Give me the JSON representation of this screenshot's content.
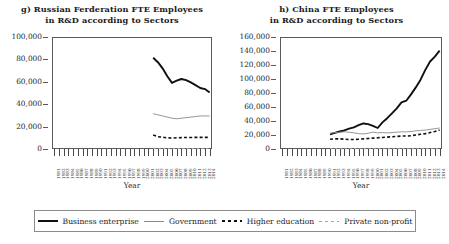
{
  "legend": {
    "items": [
      {
        "key": "business",
        "label": "Business enterprise",
        "color": "#101010",
        "style": "solid-thick"
      },
      {
        "key": "government",
        "label": "Government",
        "color": "#8a8a8a",
        "style": "solid-thin"
      },
      {
        "key": "higher",
        "label": "Higher education",
        "color": "#101010",
        "style": "dashed-thick"
      },
      {
        "key": "private",
        "label": "Private non-profit",
        "color": "#a6a6a6",
        "style": "dashed-thin"
      }
    ]
  },
  "chart_data": [
    {
      "type": "line",
      "panel": "g",
      "title_line1": "g) Russian Ferderation FTE Employees",
      "title_line2": "in R&D according to Sectors",
      "xlabel": "Year",
      "ylabel": "",
      "ylim": [
        0,
        100000
      ],
      "yticks": [
        0,
        20000,
        40000,
        60000,
        80000,
        100000
      ],
      "ytick_labels": [
        "0",
        "20,000",
        "40,000",
        "60,000",
        "80,000",
        "100,000"
      ],
      "grid": false,
      "legend_position": "bottom",
      "x": [
        1981,
        1982,
        1983,
        1984,
        1985,
        1986,
        1987,
        1988,
        1989,
        1990,
        1991,
        1992,
        1993,
        1994,
        1995,
        1996,
        1997,
        1998,
        1999,
        2000,
        2001,
        2002,
        2003,
        2004,
        2005,
        2006,
        2007,
        2008,
        2009,
        2010,
        2011,
        2012,
        2013,
        2014
      ],
      "xtick_labels": [
        "1981",
        "1982",
        "1983",
        "1984",
        "1985",
        "1986",
        "1987",
        "1988",
        "1989",
        "1990",
        "1991",
        "1992",
        "1993",
        "1994",
        "1995",
        "1996",
        "1997",
        "1998",
        "1999",
        "2000",
        "2001",
        "2002",
        "2003",
        "2004",
        "2005",
        "2006",
        "2007",
        "2008",
        "2009",
        "2010",
        "2011",
        "2012",
        "2013",
        "2014"
      ],
      "series": [
        {
          "name": "Business enterprise",
          "color": "#101010",
          "style": "solid-thick",
          "values": [
            null,
            null,
            null,
            null,
            null,
            null,
            null,
            null,
            null,
            null,
            null,
            null,
            null,
            null,
            null,
            null,
            null,
            null,
            null,
            null,
            null,
            81500,
            77500,
            72000,
            65000,
            59000,
            61000,
            62500,
            61500,
            59500,
            57000,
            54500,
            53500,
            50500
          ]
        },
        {
          "name": "Government",
          "color": "#8a8a8a",
          "style": "solid-thin",
          "values": [
            null,
            null,
            null,
            null,
            null,
            null,
            null,
            null,
            null,
            null,
            null,
            null,
            null,
            null,
            null,
            null,
            null,
            null,
            null,
            null,
            null,
            31500,
            30500,
            29500,
            28500,
            27500,
            27000,
            27500,
            28000,
            28500,
            29000,
            29500,
            29500,
            29500
          ]
        },
        {
          "name": "Higher education",
          "color": "#101010",
          "style": "dashed-thick",
          "values": [
            null,
            null,
            null,
            null,
            null,
            null,
            null,
            null,
            null,
            null,
            null,
            null,
            null,
            null,
            null,
            null,
            null,
            null,
            null,
            null,
            null,
            12500,
            11000,
            10500,
            10000,
            9800,
            10000,
            10200,
            10300,
            10300,
            10400,
            10400,
            10400,
            10300
          ]
        },
        {
          "name": "Private non-profit",
          "color": "#a6a6a6",
          "style": "dashed-thin",
          "values": [
            null,
            null,
            null,
            null,
            null,
            null,
            null,
            null,
            null,
            null,
            null,
            null,
            null,
            null,
            null,
            null,
            null,
            null,
            null,
            null,
            null,
            600,
            550,
            500,
            480,
            450,
            450,
            430,
            420,
            420,
            400,
            400,
            400,
            400
          ]
        }
      ]
    },
    {
      "type": "line",
      "panel": "h",
      "title_line1": "h) China FTE Employees",
      "title_line2": "in R&D according to Sectors",
      "xlabel": "Year",
      "ylabel": "",
      "ylim": [
        0,
        160000
      ],
      "yticks": [
        0,
        20000,
        40000,
        60000,
        80000,
        100000,
        120000,
        140000,
        160000
      ],
      "ytick_labels": [
        "0",
        "20,000",
        "40,000",
        "60,000",
        "80,000",
        "100,000",
        "120,000",
        "140,000",
        "160,000"
      ],
      "grid": false,
      "legend_position": "bottom",
      "x": [
        1981,
        1982,
        1983,
        1984,
        1985,
        1986,
        1987,
        1988,
        1989,
        1990,
        1991,
        1992,
        1993,
        1994,
        1995,
        1996,
        1997,
        1998,
        1999,
        2000,
        2001,
        2002,
        2003,
        2004,
        2005,
        2006,
        2007,
        2008,
        2009,
        2010,
        2011,
        2012,
        2013,
        2014
      ],
      "xtick_labels": [
        "1981",
        "1982",
        "1983",
        "1984",
        "1985",
        "1986",
        "1987",
        "1988",
        "1989",
        "1990",
        "1991",
        "1992",
        "1993",
        "1994",
        "1995",
        "1996",
        "1997",
        "1998",
        "1999",
        "2000",
        "2001",
        "2002",
        "2003",
        "2004",
        "2005",
        "2006",
        "2007",
        "2008",
        "2009",
        "2010",
        "2011",
        "2012",
        "2013",
        "2014"
      ],
      "series": [
        {
          "name": "Business enterprise",
          "color": "#101010",
          "style": "solid-thick",
          "values": [
            null,
            null,
            null,
            null,
            null,
            null,
            null,
            null,
            null,
            null,
            21000,
            23000,
            25000,
            26500,
            29000,
            31000,
            34000,
            36500,
            35500,
            33000,
            30000,
            38000,
            44000,
            51000,
            58000,
            66500,
            69000,
            78000,
            88000,
            99000,
            113000,
            125000,
            132000,
            140500
          ]
        },
        {
          "name": "Government",
          "color": "#8a8a8a",
          "style": "solid-thin",
          "values": [
            null,
            null,
            null,
            null,
            null,
            null,
            null,
            null,
            null,
            null,
            22500,
            23500,
            24000,
            24500,
            24000,
            23000,
            22000,
            21500,
            22500,
            24000,
            23000,
            23500,
            23000,
            23500,
            24000,
            24500,
            24500,
            25000,
            26000,
            26500,
            27000,
            28000,
            29000,
            30000
          ]
        },
        {
          "name": "Higher education",
          "color": "#101010",
          "style": "dashed-thick",
          "values": [
            null,
            null,
            null,
            null,
            null,
            null,
            null,
            null,
            null,
            null,
            14000,
            14500,
            14500,
            14000,
            13500,
            13500,
            14000,
            14500,
            15000,
            15500,
            16000,
            16500,
            17000,
            17500,
            18000,
            18500,
            18500,
            19000,
            20000,
            21000,
            22000,
            23500,
            25000,
            27000
          ]
        },
        {
          "name": "Private non-profit",
          "color": "#a6a6a6",
          "style": "dashed-thin",
          "values": [
            null,
            null,
            null,
            null,
            null,
            null,
            null,
            null,
            null,
            null,
            500,
            500,
            500,
            500,
            500,
            500,
            500,
            500,
            500,
            500,
            500,
            500,
            500,
            500,
            500,
            500,
            500,
            500,
            500,
            500,
            500,
            500,
            500,
            500
          ]
        }
      ]
    }
  ]
}
